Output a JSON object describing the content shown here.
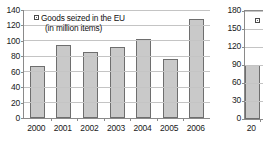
{
  "chart_data": [
    {
      "id": "primary",
      "type": "bar",
      "title": "",
      "xlabel": "",
      "ylabel": "",
      "categories": [
        "2000",
        "2001",
        "2002",
        "2003",
        "2004",
        "2005",
        "2006"
      ],
      "values": [
        68,
        95,
        85,
        92,
        103,
        76,
        128
      ],
      "ylim": [
        0,
        140
      ],
      "yticks": [
        0,
        20,
        40,
        60,
        80,
        100,
        120,
        140
      ],
      "ytick_labels": [
        "0",
        "20",
        "40",
        "60",
        "80",
        "100",
        "120",
        "140"
      ],
      "grid": true,
      "legend_position": "top-left",
      "legend": [
        {
          "label": "Goods seized in the EU",
          "sublabel": "(in million items)",
          "marker": "legend-swatch-icon",
          "color": "#c9c9c9"
        }
      ]
    },
    {
      "id": "secondary",
      "type": "bar",
      "title": "",
      "xlabel": "",
      "ylabel": "",
      "note": "chart cropped at right edge of screenshot",
      "categories": [
        "20"
      ],
      "values": [
        90
      ],
      "ylim": [
        0,
        180
      ],
      "yticks": [
        0,
        30,
        60,
        90,
        120,
        150,
        180
      ],
      "ytick_labels": [
        "0",
        "30",
        "60",
        "90",
        "120",
        "150",
        "180"
      ],
      "grid": true,
      "legend_position": "top-left",
      "legend": [
        {
          "label": "",
          "sublabel": "",
          "marker": "legend-swatch-icon",
          "color": "#c9c9c9"
        }
      ]
    }
  ],
  "colors": {
    "bar_fill": "#c9c9c9",
    "bar_border": "#6e6e6e",
    "gridline": "#c4c4c4",
    "axis": "#8a8a8a",
    "text": "#1a1a1a",
    "background": "#ffffff"
  }
}
